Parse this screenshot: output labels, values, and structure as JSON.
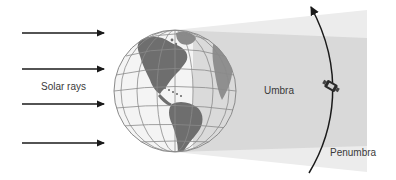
{
  "diagram": {
    "labels": {
      "solar_rays": "Solar rays",
      "umbra": "Umbra",
      "penumbra": "Penumbra"
    },
    "elements": {
      "sun_rays": {
        "count": 4,
        "direction": "left-to-right",
        "y_positions": [
          33,
          69,
          104,
          143
        ]
      },
      "earth": {
        "icon": "globe-icon",
        "view": "Americas"
      },
      "shadow": {
        "regions": [
          "umbra",
          "penumbra"
        ]
      },
      "orbit": {
        "icon": "orbit-arrow-icon",
        "direction": "upward"
      },
      "satellite": {
        "icon": "satellite-icon"
      }
    },
    "colors": {
      "penumbra": "#ececec",
      "umbra": "#d9d9d9",
      "land": "#6e6e6e",
      "ocean": "#f4f4f4",
      "grid": "#8a8a8a",
      "arrow": "#1a1a1a",
      "text": "#3a3a3a"
    }
  }
}
